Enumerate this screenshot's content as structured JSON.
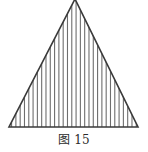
{
  "figure": {
    "caption_label": "图",
    "caption_number": "15",
    "caption_full": "图 15",
    "background_color": "#ffffff",
    "stroke_color": "#3a3a3a",
    "hatch_color": "#6e6e6e",
    "outline_width_px": 1.6,
    "hatch_width_px": 1.1,
    "shape_name": "triangle",
    "hatch_direction": "vertical",
    "hatch_line_count": 29,
    "hatch_spacing_px": 4.3,
    "vertices": {
      "apex": {
        "x": 75,
        "y": -1
      },
      "bottom_left": {
        "x": 9,
        "y": 127
      },
      "bottom_right": {
        "x": 138,
        "y": 127
      }
    }
  },
  "chart_data": {
    "type": "diagram",
    "title": "图 15",
    "shapes": [
      {
        "name": "hatched-triangle",
        "kind": "polygon",
        "points": [
          [
            75,
            -1
          ],
          [
            138,
            127
          ],
          [
            9,
            127
          ]
        ],
        "fill": "vertical-hatch",
        "stroke": "#3a3a3a"
      }
    ]
  }
}
